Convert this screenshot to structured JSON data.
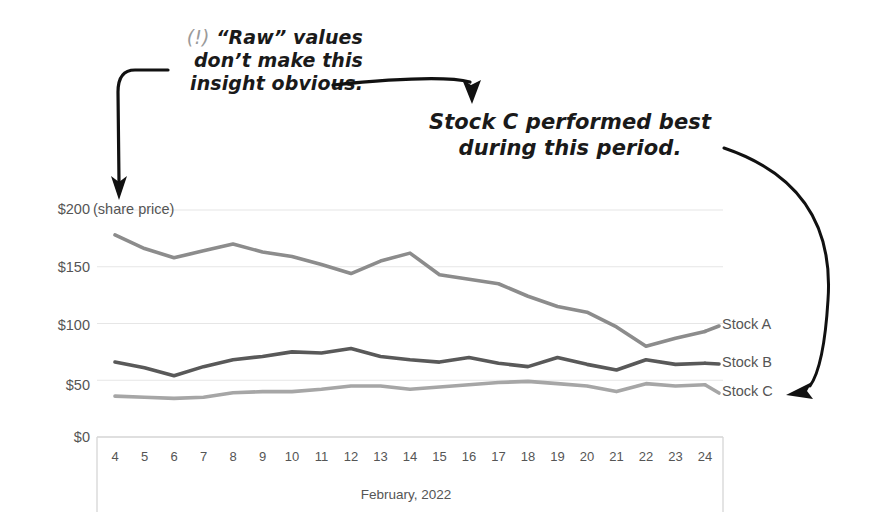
{
  "annotations": {
    "callout_raw": {
      "marker": "(!)",
      "line1": "“Raw” values",
      "line2": "don’t make this",
      "line3": "insight obvious."
    },
    "callout_insight": {
      "line1": "Stock C performed best",
      "line2": "during this period."
    }
  },
  "chart_data": {
    "type": "line",
    "title": "",
    "xlabel": "February, 2022",
    "ylabel": "",
    "unit_note": "(share price)",
    "x": [
      4,
      5,
      6,
      7,
      8,
      9,
      10,
      11,
      12,
      13,
      14,
      15,
      16,
      17,
      18,
      19,
      20,
      21,
      22,
      23,
      24
    ],
    "categories": [
      "4",
      "5",
      "6",
      "7",
      "8",
      "9",
      "10",
      "11",
      "12",
      "13",
      "14",
      "15",
      "16",
      "17",
      "18",
      "19",
      "20",
      "21",
      "22",
      "23",
      "24"
    ],
    "ytick_labels": [
      "$200",
      "$150",
      "$100",
      "$50",
      "$0"
    ],
    "yticks": [
      200,
      150,
      100,
      50,
      0
    ],
    "ylim": [
      0,
      200
    ],
    "xlim": [
      4,
      24
    ],
    "grid": true,
    "legend_position": "right-inline",
    "series": [
      {
        "name": "Stock A",
        "color": "#8c8c8c",
        "values": [
          178,
          166,
          158,
          164,
          170,
          163,
          159,
          152,
          144,
          155,
          162,
          143,
          139,
          135,
          124,
          115,
          110,
          97,
          80,
          87,
          93
        ]
      },
      {
        "name": "Stock B",
        "color": "#595959",
        "values": [
          66,
          61,
          54,
          62,
          68,
          71,
          75,
          74,
          78,
          71,
          68,
          66,
          70,
          65,
          62,
          70,
          64,
          59,
          68,
          64,
          65
        ]
      },
      {
        "name": "Stock C",
        "color": "#a6a6a6",
        "values": [
          36,
          35,
          34,
          35,
          39,
          40,
          40,
          42,
          45,
          45,
          42,
          44,
          46,
          48,
          49,
          47,
          45,
          40,
          47,
          45,
          46
        ]
      }
    ]
  }
}
